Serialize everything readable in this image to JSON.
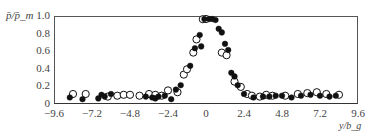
{
  "chart_data": {
    "type": "scatter",
    "title": "",
    "xlabel": "y/b_g",
    "ylabel": "p̄/p̄_m",
    "xlim": [
      -9.6,
      9.6
    ],
    "ylim": [
      0,
      1.0
    ],
    "x_ticks": [
      "−9.6",
      "−7.2",
      "−4.8",
      "−2.4",
      "0",
      "2.4",
      "4.8",
      "7.2",
      "9.6"
    ],
    "y_ticks": [
      "0",
      "0.2",
      "0.4",
      "0.6",
      "0.8",
      "1.0"
    ],
    "grid": false,
    "legend": null,
    "series": [
      {
        "name": "open circles",
        "marker": "open-circle",
        "points": [
          [
            -8.4,
            0.08
          ],
          [
            -7.6,
            0.08
          ],
          [
            -6.2,
            0.05
          ],
          [
            -5.6,
            0.06
          ],
          [
            -5.2,
            0.07
          ],
          [
            -4.8,
            0.07
          ],
          [
            -4.2,
            0.06
          ],
          [
            -3.6,
            0.08
          ],
          [
            -3.2,
            0.07
          ],
          [
            -2.8,
            0.06
          ],
          [
            -2.4,
            0.12
          ],
          [
            -1.8,
            0.1
          ],
          [
            -1.4,
            0.3
          ],
          [
            -1.2,
            0.36
          ],
          [
            -0.8,
            0.55
          ],
          [
            -0.6,
            0.7
          ],
          [
            -0.2,
            0.93
          ],
          [
            0.0,
            0.97
          ],
          [
            1.0,
            0.55
          ],
          [
            1.3,
            0.52
          ],
          [
            1.8,
            0.22
          ],
          [
            2.2,
            0.16
          ],
          [
            2.6,
            0.08
          ],
          [
            2.9,
            0.06
          ],
          [
            3.4,
            0.05
          ],
          [
            3.8,
            0.07
          ],
          [
            4.2,
            0.06
          ],
          [
            5.0,
            0.06
          ],
          [
            5.8,
            0.08
          ],
          [
            6.4,
            0.09
          ],
          [
            7.0,
            0.1
          ],
          [
            7.6,
            0.08
          ],
          [
            8.4,
            0.07
          ]
        ]
      },
      {
        "name": "filled circles",
        "marker": "filled-circle",
        "points": [
          [
            -8.6,
            0.04
          ],
          [
            -7.8,
            0.02
          ],
          [
            -6.8,
            0.03
          ],
          [
            -6.6,
            0.07
          ],
          [
            -6.4,
            0.05
          ],
          [
            -6.0,
            0.08
          ],
          [
            -3.8,
            0.05
          ],
          [
            -3.4,
            0.04
          ],
          [
            -3.2,
            0.03
          ],
          [
            -3.0,
            0.05
          ],
          [
            -2.6,
            0.06
          ],
          [
            -2.2,
            0.02
          ],
          [
            -1.9,
            0.13
          ],
          [
            -1.6,
            0.18
          ],
          [
            -1.0,
            0.4
          ],
          [
            -0.7,
            0.6
          ],
          [
            -0.4,
            0.75
          ],
          [
            -0.3,
            0.62
          ],
          [
            -0.1,
            0.95
          ],
          [
            0.2,
            1.0
          ],
          [
            0.4,
            1.0
          ],
          [
            0.6,
            0.92
          ],
          [
            0.8,
            0.82
          ],
          [
            1.0,
            0.78
          ],
          [
            1.2,
            0.65
          ],
          [
            1.4,
            0.58
          ],
          [
            1.6,
            0.32
          ],
          [
            1.8,
            0.28
          ],
          [
            2.0,
            0.18
          ],
          [
            2.4,
            0.08
          ],
          [
            3.0,
            0.04
          ],
          [
            3.6,
            0.05
          ],
          [
            4.0,
            0.05
          ],
          [
            4.4,
            0.06
          ],
          [
            4.8,
            0.06
          ],
          [
            5.4,
            0.04
          ],
          [
            6.0,
            0.06
          ],
          [
            6.6,
            0.07
          ],
          [
            7.2,
            0.06
          ],
          [
            7.8,
            0.05
          ],
          [
            8.2,
            0.06
          ]
        ]
      }
    ]
  }
}
